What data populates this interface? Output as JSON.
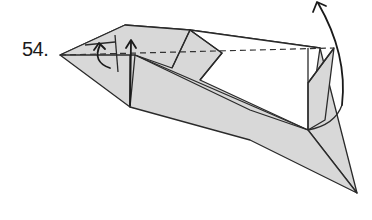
{
  "diagram": {
    "step_number": "54.",
    "colors": {
      "paper_colored_side": "#d8d8d8",
      "paper_white_side": "#ffffff",
      "lines": "#2a2a2a"
    },
    "symbols": [
      {
        "name": "valley-fold-line",
        "type": "dashed"
      },
      {
        "name": "fold-up-arrow-large",
        "type": "curved-arrow"
      },
      {
        "name": "fold-up-arrow-small-left",
        "type": "arrow"
      },
      {
        "name": "fold-up-arrow-small-center",
        "type": "arrow"
      }
    ]
  }
}
